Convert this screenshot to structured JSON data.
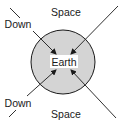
{
  "diagram": {
    "center_label": "Earth",
    "labels": {
      "top": "Space",
      "bottom": "Space",
      "upper_left": "Down",
      "lower_left": "Down"
    },
    "colors": {
      "earth_fill": "#d4d4d4",
      "stroke": "#1a1a1a",
      "background": "#ffffff"
    }
  }
}
